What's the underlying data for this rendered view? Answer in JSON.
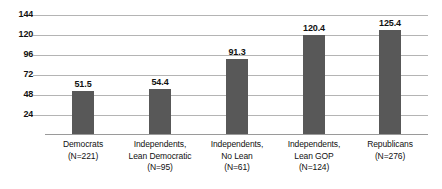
{
  "chart_data": {
    "type": "bar",
    "title": "",
    "subtitle": "",
    "xlabel": "",
    "ylabel": "",
    "ylim": [
      0,
      144
    ],
    "grid": true,
    "legend": "none",
    "yticks": [
      144,
      120,
      96,
      72,
      48,
      24
    ],
    "categories": [
      "Democrats (N=221)",
      "Independents, Lean Democratic (N=95)",
      "Independents, No Lean (N=61)",
      "Independents, Lean GOP (N=124)",
      "Republicans (N=276)"
    ],
    "values": [
      51.5,
      54.4,
      91.3,
      120.4,
      125.4
    ],
    "bar_color": "#585858",
    "gridline_color": "#b4b4b4"
  },
  "yaxis": {
    "ticks": [
      {
        "label": "144",
        "value": 144
      },
      {
        "label": "120",
        "value": 120
      },
      {
        "label": "96",
        "value": 96
      },
      {
        "label": "72",
        "value": 72
      },
      {
        "label": "48",
        "value": 48
      },
      {
        "label": "24",
        "value": 24
      }
    ]
  },
  "bars": [
    {
      "value": 51.5,
      "value_label": "51.5",
      "name": "democrats",
      "label_lines": [
        "Democrats",
        "(N=221)"
      ]
    },
    {
      "value": 54.4,
      "value_label": "54.4",
      "name": "independents-lean-democratic",
      "label_lines": [
        "Independents,",
        "Lean Democratic",
        "(N=95)"
      ]
    },
    {
      "value": 91.3,
      "value_label": "91.3",
      "name": "independents-no-lean",
      "label_lines": [
        "Independents,",
        "No Lean",
        "(N=61)"
      ]
    },
    {
      "value": 120.4,
      "value_label": "120.4",
      "name": "independents-lean-gop",
      "label_lines": [
        "Independents,",
        "Lean GOP",
        "(N=124)"
      ]
    },
    {
      "value": 125.4,
      "value_label": "125.4",
      "name": "republicans",
      "label_lines": [
        "Republicans",
        "(N=276)"
      ]
    }
  ]
}
